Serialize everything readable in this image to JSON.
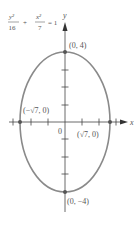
{
  "equation": {
    "num1": "y²",
    "den1": "16",
    "plus": "+",
    "num2": "x²",
    "den2": "7",
    "equals": "= 1"
  },
  "axes": {
    "x_label": "x",
    "y_label": "y",
    "origin_label": "0"
  },
  "points": {
    "top": "(0, 4)",
    "bottom": "(0, −4)",
    "left": "(−√7, 0)",
    "right": "(√7, 0)"
  },
  "colors": {
    "curve": "#8a8a8a",
    "axis": "#444444",
    "text": "#555555",
    "point": "#555555"
  }
}
